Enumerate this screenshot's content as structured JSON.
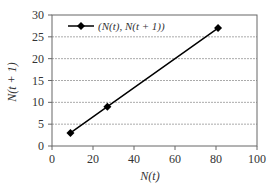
{
  "chart_data": {
    "type": "line",
    "title": "",
    "xlabel": "N(t)",
    "ylabel": "N(t + 1)",
    "xlim": [
      0,
      100
    ],
    "ylim": [
      0,
      30
    ],
    "xticks": [
      0,
      20,
      40,
      60,
      80,
      100
    ],
    "yticks": [
      0,
      5,
      10,
      15,
      20,
      25,
      30
    ],
    "grid": {
      "horizontal": true,
      "vertical": false,
      "style": "dashed"
    },
    "legend_position": "top-left inside",
    "series": [
      {
        "name": "(N(t), N(t + 1))",
        "marker": "diamond",
        "color": "#000000",
        "x": [
          9,
          27,
          81
        ],
        "values": [
          3,
          9,
          27
        ]
      }
    ]
  },
  "labels": {
    "xlabel": "N(t)",
    "ylabel": "N(t + 1)",
    "legend": "(N(t), N(t + 1))",
    "xticks": [
      "0",
      "20",
      "40",
      "60",
      "80",
      "100"
    ],
    "yticks": [
      "0",
      "5",
      "10",
      "15",
      "20",
      "25",
      "30"
    ]
  }
}
